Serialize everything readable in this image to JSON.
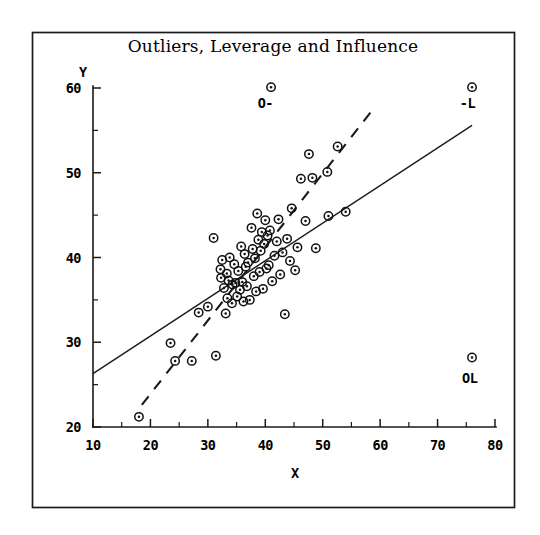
{
  "chart_data": {
    "type": "scatter",
    "title": "Outliers, Leverage and Influence",
    "xlabel": "X",
    "ylabel": "Y",
    "xlim": [
      10,
      80
    ],
    "ylim": [
      20,
      60
    ],
    "grid": false,
    "legend": "none",
    "x_ticks": [
      10,
      20,
      30,
      40,
      50,
      60,
      70,
      80
    ],
    "x_tick_labels": [
      "10",
      "20",
      "30",
      "40",
      "50",
      "60",
      "70",
      "80"
    ],
    "x_minor_ticks": [
      15,
      25,
      35,
      45,
      55,
      65,
      75
    ],
    "y_ticks": [
      20,
      30,
      40,
      50,
      60
    ],
    "y_tick_labels": [
      "20",
      "30",
      "40",
      "50",
      "60"
    ],
    "y_minor_ticks": [
      25,
      35,
      45,
      55
    ],
    "marker": "circle-dot",
    "points": [
      [
        18.0,
        21.2
      ],
      [
        23.5,
        29.9
      ],
      [
        24.3,
        27.8
      ],
      [
        27.2,
        27.8
      ],
      [
        28.4,
        33.5
      ],
      [
        30.0,
        34.2
      ],
      [
        31.0,
        42.3
      ],
      [
        31.4,
        28.4
      ],
      [
        32.2,
        38.6
      ],
      [
        32.3,
        37.6
      ],
      [
        32.5,
        39.7
      ],
      [
        32.8,
        36.4
      ],
      [
        33.1,
        33.4
      ],
      [
        33.3,
        38.1
      ],
      [
        33.4,
        35.2
      ],
      [
        33.6,
        37.3
      ],
      [
        33.8,
        40.0
      ],
      [
        34.2,
        34.6
      ],
      [
        34.3,
        36.8
      ],
      [
        34.6,
        39.2
      ],
      [
        34.8,
        37.0
      ],
      [
        35.1,
        35.4
      ],
      [
        35.3,
        38.4
      ],
      [
        35.6,
        36.2
      ],
      [
        35.8,
        41.3
      ],
      [
        36.0,
        37.1
      ],
      [
        36.2,
        34.8
      ],
      [
        36.4,
        40.4
      ],
      [
        36.6,
        38.9
      ],
      [
        36.8,
        36.6
      ],
      [
        37.0,
        39.4
      ],
      [
        37.3,
        35.0
      ],
      [
        37.6,
        43.5
      ],
      [
        37.8,
        41.0
      ],
      [
        38.0,
        37.8
      ],
      [
        38.2,
        39.9
      ],
      [
        38.4,
        36.0
      ],
      [
        38.6,
        45.2
      ],
      [
        38.8,
        42.1
      ],
      [
        39.0,
        38.3
      ],
      [
        39.2,
        40.8
      ],
      [
        39.4,
        43.0
      ],
      [
        39.6,
        36.3
      ],
      [
        39.8,
        41.6
      ],
      [
        40.0,
        44.4
      ],
      [
        40.2,
        38.7
      ],
      [
        40.4,
        42.6
      ],
      [
        40.6,
        39.1
      ],
      [
        40.8,
        43.2
      ],
      [
        41.0,
        60.1
      ],
      [
        41.2,
        37.2
      ],
      [
        41.6,
        40.2
      ],
      [
        42.0,
        41.9
      ],
      [
        42.3,
        44.5
      ],
      [
        42.6,
        38.0
      ],
      [
        43.0,
        40.6
      ],
      [
        43.4,
        33.3
      ],
      [
        43.8,
        42.2
      ],
      [
        44.3,
        39.6
      ],
      [
        44.6,
        45.8
      ],
      [
        45.2,
        38.5
      ],
      [
        45.6,
        41.2
      ],
      [
        46.2,
        49.3
      ],
      [
        47.0,
        44.3
      ],
      [
        47.6,
        52.2
      ],
      [
        48.2,
        49.4
      ],
      [
        48.8,
        41.1
      ],
      [
        50.8,
        50.1
      ],
      [
        51.0,
        44.9
      ],
      [
        52.6,
        53.1
      ],
      [
        54.0,
        45.4
      ],
      [
        76.0,
        60.1
      ],
      [
        76.0,
        28.2
      ]
    ],
    "lines": [
      {
        "name": "ols-all-data",
        "style": "solid",
        "x": [
          10.0,
          76.0
        ],
        "y": [
          26.3,
          55.6
        ]
      },
      {
        "name": "ols-clean-data",
        "style": "dashed",
        "x": [
          18.5,
          59.0
        ],
        "y": [
          22.6,
          57.7
        ]
      }
    ],
    "annotations": [
      {
        "id": "outlier-label",
        "text": "O-",
        "x": 40.0,
        "y": 57.6
      },
      {
        "id": "leverage-label",
        "text": "-L",
        "x": 75.2,
        "y": 57.6
      },
      {
        "id": "outlier-leverage-label",
        "text": "OL",
        "x": 75.6,
        "y": 25.2
      }
    ]
  },
  "figure": {
    "background_color": "#ffffff",
    "ink_color": "#111111"
  }
}
